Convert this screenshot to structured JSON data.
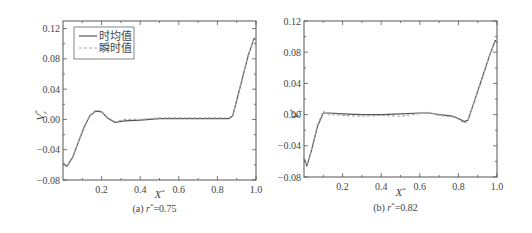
{
  "chart_data": [
    {
      "type": "line",
      "panel": "a",
      "caption": "(a) r*=0.75",
      "caption_parts": {
        "prefix": "(a) ",
        "var": "r",
        "sup": "*",
        "suffix": "=0.75"
      },
      "xlabel": "X*",
      "ylabel": "Vr*",
      "xlim": [
        0,
        1.0
      ],
      "ylim": [
        -0.08,
        0.13
      ],
      "xticks": [
        "0.2",
        "0.4",
        "0.6",
        "0.8",
        "1.0"
      ],
      "yticks": [
        "0.12",
        "0.08",
        "0.04",
        "0.00",
        "−0.04",
        "−0.08"
      ],
      "legend": {
        "position": "upper-left",
        "entries": [
          "时均值",
          "瞬时值"
        ]
      },
      "series": [
        {
          "name": "时均值",
          "style": "solid",
          "color": "#555555",
          "x": [
            0.0,
            0.02,
            0.05,
            0.08,
            0.11,
            0.14,
            0.17,
            0.2,
            0.23,
            0.27,
            0.32,
            0.4,
            0.5,
            0.6,
            0.7,
            0.8,
            0.86,
            0.88,
            0.9,
            0.93,
            0.96,
            0.99,
            1.0
          ],
          "y": [
            -0.058,
            -0.062,
            -0.05,
            -0.03,
            -0.01,
            0.005,
            0.011,
            0.01,
            0.002,
            -0.004,
            -0.002,
            -0.001,
            0.001,
            0.001,
            0.001,
            0.001,
            0.001,
            0.005,
            0.025,
            0.055,
            0.085,
            0.107,
            0.105
          ]
        },
        {
          "name": "瞬时值",
          "style": "dashed",
          "color": "#aaaaaa",
          "x": [
            0.0,
            0.02,
            0.05,
            0.08,
            0.11,
            0.14,
            0.17,
            0.2,
            0.23,
            0.27,
            0.32,
            0.4,
            0.5,
            0.6,
            0.7,
            0.8,
            0.86,
            0.88,
            0.9,
            0.93,
            0.96,
            0.99,
            1.0
          ],
          "y": [
            -0.057,
            -0.061,
            -0.049,
            -0.029,
            -0.009,
            0.006,
            0.012,
            0.011,
            0.003,
            -0.003,
            0.0,
            0.0,
            0.002,
            0.002,
            0.002,
            0.002,
            0.002,
            0.006,
            0.026,
            0.056,
            0.086,
            0.106,
            0.104
          ]
        }
      ]
    },
    {
      "type": "line",
      "panel": "b",
      "caption": "(b) r*=0.82",
      "caption_parts": {
        "prefix": "(b) ",
        "var": "r",
        "sup": "*",
        "suffix": "=0.82"
      },
      "xlabel": "X*",
      "ylabel": "Vr*",
      "xlim": [
        0,
        1.0
      ],
      "ylim": [
        -0.08,
        0.12
      ],
      "xticks": [
        "0.2",
        "0.4",
        "0.6",
        "0.8",
        "1.0"
      ],
      "yticks": [
        "0.12",
        "0.08",
        "0.04",
        "0.00",
        "−0.04",
        "−0.08"
      ],
      "series": [
        {
          "name": "时均值",
          "style": "solid",
          "color": "#555555",
          "x": [
            0.0,
            0.015,
            0.04,
            0.07,
            0.1,
            0.13,
            0.2,
            0.3,
            0.4,
            0.5,
            0.6,
            0.65,
            0.7,
            0.77,
            0.8,
            0.83,
            0.85,
            0.88,
            0.92,
            0.96,
            0.99,
            1.0
          ],
          "y": [
            -0.055,
            -0.066,
            -0.045,
            -0.015,
            0.002,
            0.002,
            0.001,
            0.0,
            0.0,
            0.001,
            0.002,
            0.002,
            0.0,
            -0.002,
            -0.005,
            -0.009,
            -0.007,
            0.015,
            0.045,
            0.075,
            0.095,
            0.092
          ]
        },
        {
          "name": "瞬时值",
          "style": "dashed",
          "color": "#aaaaaa",
          "x": [
            0.0,
            0.015,
            0.04,
            0.07,
            0.1,
            0.13,
            0.2,
            0.3,
            0.4,
            0.5,
            0.6,
            0.65,
            0.7,
            0.77,
            0.8,
            0.83,
            0.85,
            0.88,
            0.92,
            0.96,
            0.99,
            1.0
          ],
          "y": [
            -0.054,
            -0.065,
            -0.044,
            -0.013,
            0.004,
            0.0,
            -0.001,
            -0.002,
            -0.001,
            -0.002,
            0.001,
            0.003,
            -0.001,
            -0.003,
            -0.006,
            -0.011,
            -0.008,
            0.014,
            0.044,
            0.074,
            0.094,
            0.091
          ]
        }
      ]
    }
  ]
}
